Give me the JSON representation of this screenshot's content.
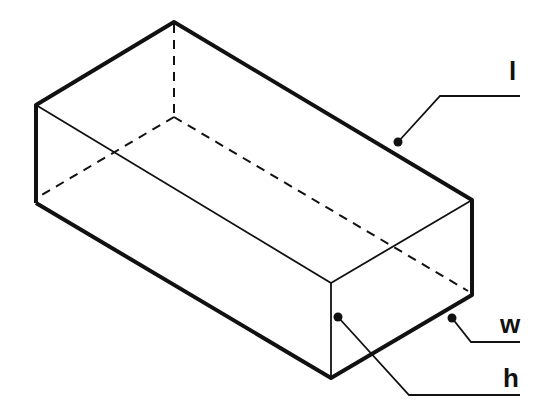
{
  "diagram": {
    "type": "isometric-cuboid",
    "colors": {
      "stroke": "#111111",
      "background": "#ffffff"
    },
    "labels": {
      "length": "l",
      "width": "w",
      "height": "h"
    }
  }
}
